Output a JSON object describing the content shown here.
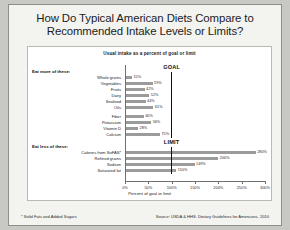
{
  "slide": {
    "title_line1": "How Do Typical American Diets Compare to",
    "title_line2": "Recommended Intake Levels or Limits?",
    "footnote": "* Solid Fats and Added Sugars",
    "source": "Source: USDA & HHS. Dietary Guidelines for Americans, 2010"
  },
  "chart_data": {
    "type": "bar",
    "orientation": "horizontal",
    "title": "Usual intake as a percent of goal or limit",
    "xlabel": "Percent of goal or limit",
    "ylabel": "",
    "xlim": [
      0,
      300
    ],
    "xticks": [
      0,
      50,
      100,
      150,
      200,
      250,
      300
    ],
    "xtick_labels": [
      "0%",
      "50%",
      "100%",
      "150%",
      "200%",
      "250%",
      "300%"
    ],
    "grid": false,
    "legend": "none",
    "bar_color": "#9b9b9b",
    "reference_color": "#111111",
    "groups": [
      {
        "heading": "Eat more of these:",
        "reference_label": "GOAL",
        "reference_value": 100,
        "categories": [
          "Whole grains",
          "Vegetables",
          "Fruits",
          "Dairy",
          "Seafood",
          "Oils",
          "Fiber",
          "Potassium",
          "Vitamin D",
          "Calcium"
        ],
        "values": [
          15,
          59,
          42,
          52,
          44,
          61,
          40,
          56,
          28,
          75
        ],
        "value_labels": [
          "15%",
          "59%",
          "42%",
          "52%",
          "44%",
          "61%",
          "40%",
          "56%",
          "28%",
          "75%"
        ]
      },
      {
        "heading": "Eat less of these:",
        "reference_label": "LIMIT",
        "reference_value": 100,
        "categories": [
          "Calories from SoFAS*",
          "Refined grains",
          "Sodium",
          "Saturated fat"
        ],
        "values": [
          280,
          200,
          149,
          110
        ],
        "value_labels": [
          "280%",
          "200%",
          "149%",
          "110%"
        ]
      }
    ]
  }
}
